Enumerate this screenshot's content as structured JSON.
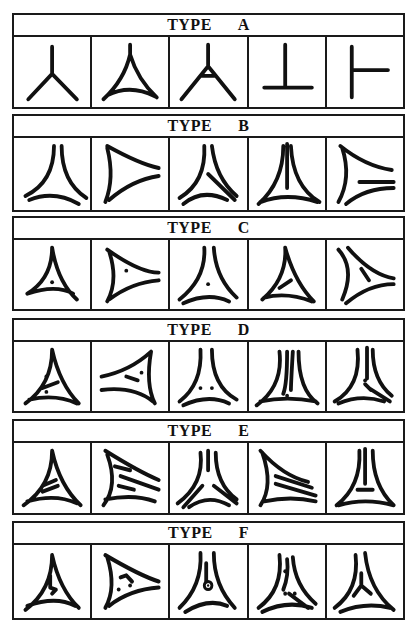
{
  "panels": [
    {
      "label_prefix": "TYPE",
      "type": "A",
      "top": 13,
      "height": 96,
      "glyphs": [
        [
          "M40 10 L40 38 M40 38 L15 64 M40 38 L66 64"
        ],
        [
          "M40 8 L40 18 Q34 44 12 64 M40 18 Q48 44 68 62 M16 60 Q40 48 66 61"
        ],
        [
          "M40 8 L40 30 M40 30 L12 64 M40 30 L68 64 M32 40 L48 40"
        ],
        [
          "M38 8 L38 50 M16 52 L66 52"
        ],
        [
          "M26 10 L26 62 M26 34 L64 34"
        ]
      ]
    },
    {
      "label_prefix": "TYPE",
      "type": "B",
      "top": 114,
      "height": 98,
      "glyphs": [
        [
          "M42 8 Q42 44 12 58 M50 8 Q50 44 76 60 M16 62 Q42 52 68 66"
        ],
        [
          "M16 8 Q50 26 70 30 M16 10 Q24 40 14 64 M18 62 Q42 42 70 38"
        ],
        [
          "M36 8 Q38 44 10 60 M44 8 Q48 40 70 58 M40 36 L68 62 M14 66 Q34 50 60 62"
        ],
        [
          "M36 8 Q36 44 10 66 M44 8 Q46 48 74 64 M40 6 L40 50 M12 64 Q40 54 72 64"
        ],
        [
          "M14 8 Q40 28 68 32 M16 10 Q26 40 12 64 M34 44 L70 44 M20 66 Q40 50 70 50"
        ]
      ]
    },
    {
      "label_prefix": "TYPE",
      "type": "C",
      "top": 216,
      "height": 95,
      "glyphs": [
        [
          "M40 8 Q40 40 14 56 M40 8 Q46 44 66 62 M14 56 Q44 46 62 56"
        ],
        [
          "M16 10 Q50 34 70 34 M18 12 Q28 42 16 64 M18 62 Q42 44 70 42"
        ],
        [
          "M36 8 Q38 40 10 62 M46 8 Q48 40 70 60 M14 66 Q40 54 62 64"
        ],
        [
          "M38 8 Q40 40 14 62 M38 8 Q48 44 68 64 M16 60 Q40 54 66 64 M32 50 L44 42"
        ],
        [
          "M12 10 Q30 30 16 62 M22 8 Q46 36 70 40 M36 30 L44 42 M20 66 Q44 46 70 46"
        ]
      ]
    },
    {
      "label_prefix": "TYPE",
      "type": "D",
      "top": 318,
      "height": 95,
      "glyphs": [
        [
          "M40 8 Q40 44 12 64 M40 8 Q48 44 68 64 M16 60 Q44 54 66 64 M30 48 L46 42"
        ],
        [
          "M10 36 Q40 30 62 10 M62 10 Q56 44 66 64 M10 50 Q44 46 64 62 M36 36 L48 40"
        ],
        [
          "M32 8 Q34 44 10 62 M44 8 Q44 46 70 60 M14 66 Q40 54 62 64"
        ],
        [
          "M32 10 Q36 46 8 66 M40 10 Q40 44 36 54 M46 10 Q44 44 44 50 M52 10 Q52 50 72 64 M12 62 Q40 56 70 62"
        ],
        [
          "M32 8 Q36 46 8 62 M42 6 L42 38 M48 8 Q48 40 68 56 M40 44 L46 50 M44 48 L66 62 M12 64 Q36 54 60 62"
        ]
      ]
    },
    {
      "label_prefix": "TYPE",
      "type": "E",
      "top": 419,
      "height": 96,
      "glyphs": [
        [
          "M40 8 Q40 44 10 64 M40 8 Q48 44 70 64 M14 60 Q44 52 66 62 M30 44 L44 38 M30 50 L46 44"
        ],
        [
          "M14 8 Q50 30 70 38 M16 12 Q28 44 12 64 M14 58 Q44 52 66 60 M24 24 L40 28 M30 34 L70 48 M28 44 L44 48"
        ],
        [
          "M32 10 Q36 42 8 62 M40 8 L40 28 M48 10 Q48 42 70 58 M34 44 L14 66 M46 44 L70 62 M20 66 Q40 52 62 64"
        ],
        [
          "M12 8 Q36 34 62 40 M14 10 Q26 44 12 64 M28 34 L66 46 M28 42 L70 54 M16 60 Q44 54 70 60"
        ],
        [
          "M34 8 Q36 44 10 64 M40 6 L40 42 M48 8 Q48 44 70 64 M32 48 L48 48 M12 64 Q40 56 70 64"
        ]
      ]
    },
    {
      "label_prefix": "TYPE",
      "type": "F",
      "top": 521,
      "height": 99,
      "glyphs": [
        [
          "M40 10 Q40 44 12 64 M40 10 Q48 44 68 62 M14 60 Q44 50 64 60 M38 30 L38 42 L44 44 L40 48"
        ],
        [
          "M14 10 Q50 30 70 36 M16 12 Q26 42 14 62 M18 60 Q40 44 70 42 M30 32 L36 30 L42 36"
        ],
        [
          "M32 8 Q34 40 10 62 M46 8 Q46 40 68 62 M38 18 L38 36 M16 66 Q40 52 60 60"
        ],
        [
          "M32 10 Q36 44 10 62 M40 14 Q42 30 36 44 M46 12 Q48 40 70 58 M42 48 L62 62 M14 66 Q40 54 66 62"
        ],
        [
          "M30 10 Q34 44 8 62 M40 8 Q44 44 70 64 M36 28 L36 40 L28 50 M36 40 L46 48 M14 66 Q40 56 66 62"
        ]
      ]
    }
  ],
  "dots": {
    "C": [
      [
        [
          40,
          44
        ]
      ],
      [
        [
          36,
          32
        ]
      ],
      [
        [
          40,
          46
        ]
      ],
      [],
      []
    ],
    "D": [
      [
        [
          34,
          36
        ],
        [
          34,
          52
        ]
      ],
      [
        [
          52,
          32
        ]
      ],
      [
        [
          32,
          48
        ],
        [
          44,
          48
        ]
      ],
      [
        [
          40,
          56
        ]
      ],
      [
        [
          40,
          40
        ]
      ]
    ],
    "F": [
      [],
      [
        [
          28,
          44
        ],
        [
          40,
          40
        ]
      ],
      [],
      [
        [
          38,
          26
        ],
        [
          38,
          48
        ],
        [
          48,
          48
        ]
      ],
      []
    ]
  },
  "rings": {
    "F": [
      [],
      [],
      [
        [
          40,
          40
        ]
      ],
      [],
      []
    ]
  }
}
